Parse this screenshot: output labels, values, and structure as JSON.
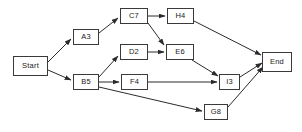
{
  "diagram": {
    "type": "directed-graph",
    "title": "",
    "background_color": "#ffffff",
    "node_border_color": "#3a3a3a",
    "node_fill_color": "#ffffff",
    "edge_color": "#2b2b2b",
    "label_color": "#1a1a1a",
    "nodes": [
      {
        "id": "start",
        "label": "Start",
        "x": 13,
        "y": 56,
        "w": 35,
        "h": 20
      },
      {
        "id": "a3",
        "label": "A3",
        "x": 73,
        "y": 29,
        "w": 26,
        "h": 16
      },
      {
        "id": "b5",
        "label": "B5",
        "x": 73,
        "y": 74,
        "w": 26,
        "h": 16
      },
      {
        "id": "c7",
        "label": "C7",
        "x": 120,
        "y": 8,
        "w": 28,
        "h": 16
      },
      {
        "id": "d2",
        "label": "D2",
        "x": 120,
        "y": 44,
        "w": 28,
        "h": 16
      },
      {
        "id": "f4",
        "label": "F4",
        "x": 121,
        "y": 74,
        "w": 27,
        "h": 16
      },
      {
        "id": "h4",
        "label": "H4",
        "x": 167,
        "y": 8,
        "w": 27,
        "h": 16
      },
      {
        "id": "e6",
        "label": "E6",
        "x": 166,
        "y": 44,
        "w": 28,
        "h": 16
      },
      {
        "id": "i3",
        "label": "I3",
        "x": 219,
        "y": 74,
        "w": 21,
        "h": 16
      },
      {
        "id": "g8",
        "label": "G8",
        "x": 204,
        "y": 104,
        "w": 24,
        "h": 16
      },
      {
        "id": "end",
        "label": "End",
        "x": 262,
        "y": 52,
        "w": 30,
        "h": 20
      }
    ],
    "edges": [
      {
        "from": "start",
        "to": "a3",
        "x1": 48,
        "y1": 62,
        "x2": 71,
        "y2": 39
      },
      {
        "from": "start",
        "to": "b5",
        "x1": 48,
        "y1": 70,
        "x2": 71,
        "y2": 80
      },
      {
        "from": "a3",
        "to": "c7",
        "x1": 99,
        "y1": 33,
        "x2": 118,
        "y2": 18
      },
      {
        "from": "b5",
        "to": "d2",
        "x1": 99,
        "y1": 77,
        "x2": 118,
        "y2": 56
      },
      {
        "from": "b5",
        "to": "f4",
        "x1": 99,
        "y1": 82,
        "x2": 119,
        "y2": 82
      },
      {
        "from": "b5",
        "to": "g8",
        "x1": 99,
        "y1": 87,
        "x2": 202,
        "y2": 111
      },
      {
        "from": "c7",
        "to": "h4",
        "x1": 148,
        "y1": 16,
        "x2": 165,
        "y2": 16
      },
      {
        "from": "c7",
        "to": "e6",
        "x1": 148,
        "y1": 23,
        "x2": 164,
        "y2": 45
      },
      {
        "from": "d2",
        "to": "e6",
        "x1": 148,
        "y1": 52,
        "x2": 164,
        "y2": 52
      },
      {
        "from": "e6",
        "to": "i3",
        "x1": 192,
        "y1": 60,
        "x2": 218,
        "y2": 76
      },
      {
        "from": "f4",
        "to": "i3",
        "x1": 148,
        "y1": 82,
        "x2": 217,
        "y2": 82
      },
      {
        "from": "h4",
        "to": "end",
        "x1": 194,
        "y1": 21,
        "x2": 261,
        "y2": 55
      },
      {
        "from": "i3",
        "to": "end",
        "x1": 240,
        "y1": 77,
        "x2": 262,
        "y2": 63
      },
      {
        "from": "g8",
        "to": "end",
        "x1": 228,
        "y1": 107,
        "x2": 263,
        "y2": 67
      }
    ]
  }
}
